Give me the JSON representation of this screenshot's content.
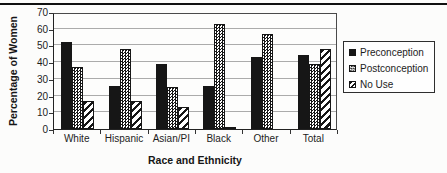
{
  "figure": {
    "y_axis_title": "Percentage of Women",
    "x_axis_title": "Race and Ethnicity"
  },
  "chart_data": {
    "type": "bar",
    "title": "",
    "categories": [
      "White",
      "Hispanic",
      "Asian/PI",
      "Black",
      "Other",
      "Total"
    ],
    "series": [
      {
        "name": "Preconception",
        "pattern": "solid",
        "values": [
          52,
          26,
          39,
          26,
          43,
          44
        ]
      },
      {
        "name": "Postconception",
        "pattern": "checker",
        "values": [
          37,
          48,
          25,
          63,
          57,
          39
        ]
      },
      {
        "name": "No Use",
        "pattern": "stripe",
        "values": [
          17,
          17,
          13,
          1,
          0,
          48
        ]
      }
    ],
    "xlabel": "Race and Ethnicity",
    "ylabel": "Percentage of Women",
    "ylim": [
      0,
      70
    ],
    "ytick_step": 10,
    "ytick_labels": [
      "0",
      "10",
      "20",
      "30",
      "40",
      "50",
      "60",
      "70"
    ],
    "grid": true,
    "legend_position": "right",
    "colors": {
      "bar": "#161616",
      "grid": "#ababab",
      "axis": "#222222",
      "background": "#fcfcfb"
    }
  }
}
